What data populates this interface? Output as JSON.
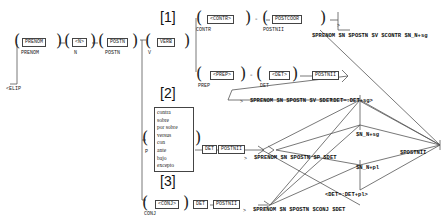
{
  "graph": {
    "initial_node": "<ELIP",
    "sections": [
      "[1]",
      "[2]",
      "[3]"
    ],
    "top_chain": [
      {
        "box": "PRENOM",
        "label": "PRENOM"
      },
      {
        "box": "<N>",
        "label": "N"
      },
      {
        "box": "POSTN",
        "label": "POSTN"
      }
    ],
    "branch1": {
      "verb": {
        "box": "VERB",
        "label": "V"
      },
      "contr": {
        "box": "<CONTR>",
        "label": "CONTR"
      },
      "postcoor": {
        "box": "POSTCOOR",
        "label": "POSTNII"
      },
      "prep": {
        "box": "<PREP>",
        "label": "PREP"
      },
      "det": {
        "box": "<DET>",
        "label": "DET"
      },
      "postnii": "POSTNII",
      "output_contr": "$PRENOM $N $POSTN $V $CONTR $N_N+sg",
      "output_det": "$PRENOM $N $POSTN $V $DET"
    },
    "branch2": {
      "prepositions": [
        "contra",
        "sobre",
        "por sobre",
        "versus",
        "con",
        "ante",
        "bajo",
        "excepto"
      ],
      "label": "P",
      "det": "DET",
      "postnii": "POSTNII",
      "output": "$PRENOM $N $POSTN $P $DET"
    },
    "branch3": {
      "conj": {
        "box": "<CONJ>",
        "label": "CONJ"
      },
      "det": "DET",
      "postnii": "POSTNII",
      "output": "$PRENOM $N $POSTN $CONJ $DET"
    },
    "agreement": {
      "det_sg": "<DET=:DET+sg>",
      "n_sg": "$N_N+sg",
      "n_pl": "$N_N+pl",
      "det_pl": "<DET=:DET+pl>"
    },
    "final_node": "$POSTNII",
    "arrow_marker": ">"
  }
}
